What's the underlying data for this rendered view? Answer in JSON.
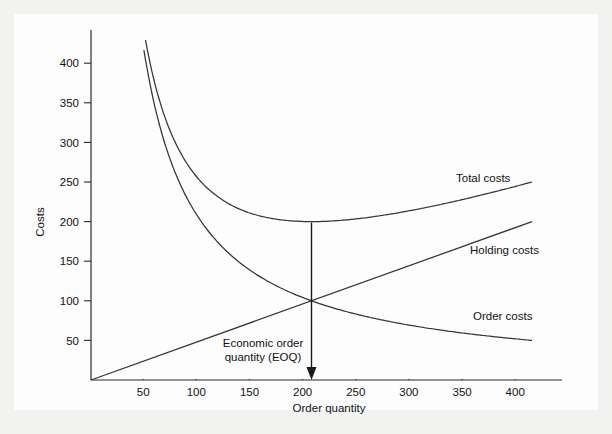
{
  "figure": {
    "background_color": "#f2f2f1",
    "panel_color": "#fdfdfd",
    "line_color": "#333333",
    "text_color": "#111111"
  },
  "chart_data": {
    "type": "line",
    "title": "",
    "xlabel": "Order quantity",
    "ylabel": "Costs",
    "xlim": [
      0,
      420
    ],
    "ylim": [
      0,
      440
    ],
    "grid": false,
    "legend_position": "inline-right",
    "xticks": [
      50,
      100,
      150,
      200,
      250,
      300,
      350,
      400
    ],
    "xtick_labels": [
      "50",
      "100",
      "150",
      "200",
      "250",
      "300",
      "350",
      "400"
    ],
    "yticks": [
      50,
      100,
      150,
      200,
      250,
      300,
      350,
      400
    ],
    "ytick_labels": [
      "50",
      "100",
      "150",
      "200",
      "250",
      "300",
      "350",
      "400"
    ],
    "x": [
      40,
      50,
      60,
      70,
      80,
      90,
      100,
      110,
      120,
      130,
      140,
      150,
      160,
      170,
      180,
      190,
      200,
      210,
      220,
      240,
      260,
      280,
      300,
      320,
      340,
      360,
      380,
      400
    ],
    "series": [
      {
        "name": "Total costs",
        "label": "Total costs",
        "label_x": 350,
        "label_y": 240,
        "values": [
          520,
          420,
          362,
          322,
          295,
          277,
          265,
          257,
          253,
          252,
          253,
          255,
          258,
          262,
          266,
          271,
          200,
          205,
          207,
          211,
          216,
          221,
          226,
          231,
          236,
          241,
          246,
          250
        ],
        "notes": "U-shaped sum of holding and order costs; minimum 200 at quantity 200"
      },
      {
        "name": "Holding costs",
        "label": "Holding costs",
        "label_x": 350,
        "label_y": 160,
        "values": [
          20,
          25,
          30,
          35,
          40,
          45,
          50,
          55,
          60,
          65,
          70,
          75,
          80,
          85,
          90,
          95,
          100,
          105,
          110,
          120,
          130,
          140,
          150,
          160,
          170,
          180,
          190,
          200
        ],
        "notes": "Linear through origin; 100 at quantity 200, 200 at quantity 400"
      },
      {
        "name": "Order costs",
        "label": "Order costs",
        "label_x": 350,
        "label_y": 88,
        "values": [
          500,
          400,
          333,
          286,
          250,
          222,
          200,
          182,
          167,
          154,
          143,
          133,
          125,
          118,
          111,
          105,
          100,
          95,
          91,
          83,
          77,
          71,
          67,
          63,
          59,
          56,
          53,
          50
        ],
        "notes": "Hyperbolic 20000/q; 100 at quantity 200, 50 at quantity 400"
      }
    ],
    "annotations": [
      {
        "name": "eoq-annotation",
        "text_line1": "Economic order",
        "text_line2": "quantity (EOQ)",
        "arrow_from": {
          "x": 200,
          "y": 200
        },
        "arrow_to": {
          "x": 200,
          "y": 0
        },
        "intersection_point": {
          "x": 200,
          "y": 100
        }
      }
    ]
  }
}
